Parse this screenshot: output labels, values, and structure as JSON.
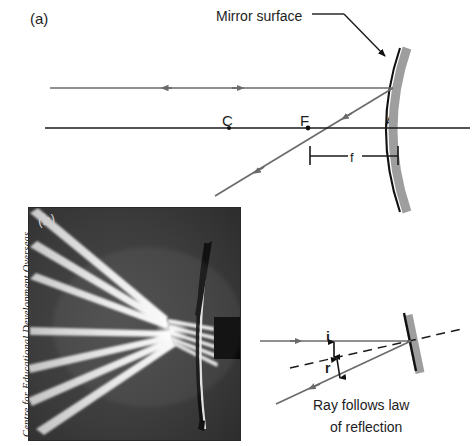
{
  "figure": {
    "panels": [
      {
        "tag": "(a)",
        "kind": "ray-diagram"
      },
      {
        "tag": "(b)",
        "kind": "photograph"
      },
      {
        "tag": "",
        "kind": "law-of-reflection-inset"
      }
    ]
  },
  "panel_a": {
    "tag": "(a)",
    "mirror_label": "Mirror surface",
    "points": [
      {
        "name": "C",
        "label": "C",
        "meaning": "centre-of-curvature"
      },
      {
        "name": "F",
        "label": "F",
        "meaning": "focal-point"
      },
      {
        "name": "A",
        "label": "A",
        "meaning": "pole-vertex"
      }
    ],
    "focal_length_label": "f",
    "colors": {
      "ray": "#6b6b6b",
      "axis": "#1a1a1a",
      "mirror_line": "#111111",
      "mirror_band": "#9e9e9e",
      "text": "#1d1d1d"
    }
  },
  "panel_b": {
    "tag": "(b)",
    "credit": "Centre for Educational Development Overseas",
    "description": "Photograph of light rays converging to a focus after reflection from a concave mirror",
    "ray_count_upper": 3,
    "ray_count_lower": 4,
    "colors": {
      "background": "#3a3a3a",
      "beam": "#efefef",
      "block": "#080808"
    }
  },
  "panel_c": {
    "angle_incidence_label": "i",
    "angle_reflection_label": "r",
    "caption_line_1": "Ray follows law",
    "caption_line_2": "of reflection",
    "colors": {
      "ray": "#6b6b6b",
      "normal": "#1a1a1a",
      "mirror_line": "#111111",
      "mirror_band": "#9e9e9e"
    }
  }
}
